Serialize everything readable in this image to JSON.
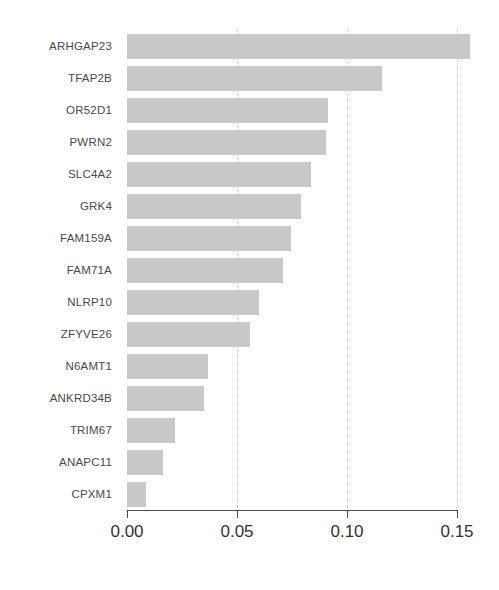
{
  "chart_data": {
    "type": "bar",
    "orientation": "horizontal",
    "title": "",
    "subtitle": "",
    "xlabel": "",
    "ylabel": "",
    "xlim": [
      0.0,
      0.15
    ],
    "ylim": null,
    "grid": "vertical-dotted",
    "legend": null,
    "legend_position": "none",
    "bar_color": "#c9c9c9",
    "axis_color": "#4d4d4d",
    "gridline_color": "#d6d6d6",
    "xticks": [
      0.0,
      0.05,
      0.1,
      0.15
    ],
    "xtick_labels": [
      "0.00",
      "0.05",
      "0.10",
      "0.15"
    ],
    "categories": [
      "ARHGAP23",
      "TFAP2B",
      "OR52D1",
      "PWRN2",
      "SLC4A2",
      "GRK4",
      "FAM159A",
      "FAM71A",
      "NLRP10",
      "ZFYVE26",
      "N6AMT1",
      "ANKRD34B",
      "TRIM67",
      "ANAPC11",
      "CPXM1"
    ],
    "values": [
      0.156,
      0.116,
      0.0915,
      0.0905,
      0.0835,
      0.079,
      0.0745,
      0.071,
      0.06,
      0.056,
      0.037,
      0.035,
      0.022,
      0.0165,
      0.0085
    ]
  }
}
